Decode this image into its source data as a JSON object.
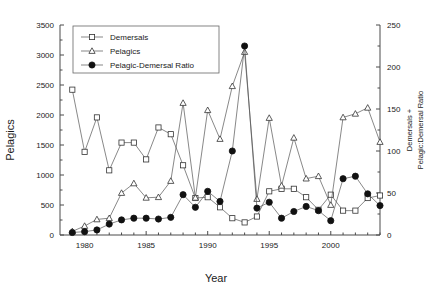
{
  "chart_data": {
    "type": "line",
    "title": "",
    "xlabel": "Year",
    "ylabel": "Pelagics",
    "y2label": "Demersals + Pelagic:Demersal Ratio",
    "xlim": [
      1978,
      2004
    ],
    "ylim": [
      0,
      3500
    ],
    "y2lim": [
      0,
      250
    ],
    "grid": false,
    "legend_position": "top-left-inside",
    "xticks": [
      1980,
      1985,
      1990,
      1995,
      2000
    ],
    "xtick_labels": [
      "1980",
      "1985",
      "1990",
      "1995",
      "2000"
    ],
    "yticks": [
      0,
      500,
      1000,
      1500,
      2000,
      2500,
      3000,
      3500
    ],
    "ytick_labels": [
      "0",
      "500",
      "1000",
      "1500",
      "2000",
      "2500",
      "3000",
      "3500"
    ],
    "y2ticks": [
      0,
      50,
      100,
      150,
      200,
      250
    ],
    "y2tick_labels": [
      "0",
      "50",
      "100",
      "150",
      "200",
      "250"
    ],
    "x": [
      1979,
      1980,
      1981,
      1982,
      1983,
      1984,
      1985,
      1986,
      1987,
      1988,
      1989,
      1990,
      1991,
      1992,
      1993,
      1994,
      1995,
      1996,
      1997,
      1998,
      1999,
      2000,
      2001,
      2002,
      2003,
      2004
    ],
    "series": [
      {
        "name": "Demersals",
        "marker": "open-square",
        "axis": "right",
        "values": [
          173,
          99,
          140,
          77,
          110,
          110,
          90,
          128,
          120,
          83,
          44,
          45,
          33,
          20,
          15,
          22,
          52,
          55,
          55,
          45,
          30,
          48,
          29,
          29,
          44,
          47
        ]
      },
      {
        "name": "Pelagics",
        "marker": "open-triangle",
        "axis": "left",
        "values": [
          60,
          150,
          260,
          280,
          700,
          860,
          620,
          630,
          900,
          2200,
          620,
          2080,
          1600,
          2480,
          3050,
          600,
          1950,
          820,
          1620,
          940,
          980,
          500,
          1960,
          2020,
          2120,
          1550
        ]
      },
      {
        "name": "Pelagic-Demersal Ratio",
        "marker": "filled-circle",
        "axis": "right",
        "values": [
          3,
          4,
          6,
          13,
          18,
          20,
          20,
          19,
          21,
          48,
          33,
          52,
          40,
          100,
          225,
          32,
          39,
          20,
          28,
          34,
          29,
          17,
          67,
          70,
          49,
          35
        ]
      }
    ],
    "series_x": {
      "Demersals": [
        1979,
        1980,
        1981,
        1982,
        1983,
        1984,
        1985,
        1986,
        1987,
        1988,
        1989,
        1990,
        1991,
        1992,
        1993,
        1994,
        1995,
        1996,
        1997,
        1998,
        1999,
        2000,
        2001,
        2002,
        2003,
        2004
      ],
      "Pelagics": [
        1979,
        1980,
        1981,
        1982,
        1983,
        1984,
        1985,
        1986,
        1987,
        1988,
        1989,
        1990,
        1991,
        1992,
        1993,
        1994,
        1995,
        1996,
        1997,
        1998,
        1999,
        2000,
        2001,
        2002,
        2003,
        2004
      ],
      "Pelagic-Demersal Ratio": [
        1979,
        1980,
        1981,
        1982,
        1983,
        1984,
        1985,
        1986,
        1987,
        1988,
        1989,
        1990,
        1991,
        1992,
        1993,
        1994,
        1995,
        1996,
        1997,
        1998,
        1999,
        2000,
        2001,
        2002,
        2003,
        2004
      ]
    }
  },
  "legend": {
    "items": [
      {
        "label": "Demersals",
        "marker": "open-square"
      },
      {
        "label": "Pelagics",
        "marker": "open-triangle"
      },
      {
        "label": "Pelagic-Demersal Ratio",
        "marker": "filled-circle"
      }
    ]
  },
  "colors": {
    "axis": "#4a4a4a",
    "line": "#555555",
    "marker_fill_open": "#ffffff",
    "marker_stroke": "#333333",
    "marker_filled": "#111111",
    "background": "#ffffff"
  }
}
